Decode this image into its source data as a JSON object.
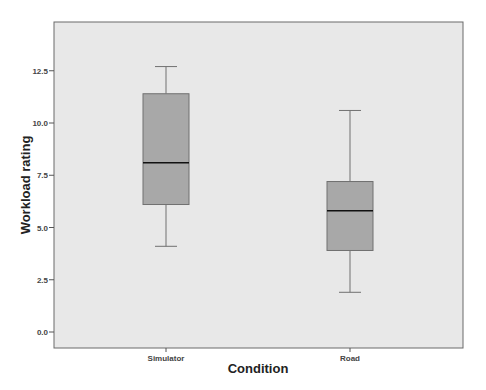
{
  "chart_data": {
    "type": "box",
    "title": "",
    "xlabel": "Condition",
    "ylabel": "Workload rating",
    "ylim": [
      -0.8,
      14.6
    ],
    "yticks": [
      0.0,
      2.5,
      5.0,
      7.5,
      10.0,
      12.5
    ],
    "ytick_labels": [
      "0.0",
      "2.5",
      "5.0",
      "7.5",
      "10.0",
      "12.5"
    ],
    "categories": [
      "Simulator",
      "Road"
    ],
    "grid": false,
    "legend": null,
    "series": [
      {
        "name": "Simulator",
        "whisker_low": 4.1,
        "q1": 6.1,
        "median": 8.1,
        "q3": 11.4,
        "whisker_high": 12.7
      },
      {
        "name": "Road",
        "whisker_low": 1.9,
        "q1": 3.9,
        "median": 5.8,
        "q3": 7.2,
        "whisker_high": 10.6
      }
    ],
    "colors": {
      "plot_background": "#e8e8e8",
      "box_fill": "#a8a8a8",
      "box_border": "#707070",
      "median": "#111111",
      "whisker": "#707070",
      "frame": "#6a6a6a"
    }
  }
}
